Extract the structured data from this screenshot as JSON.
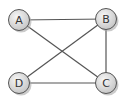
{
  "diagram": {
    "type": "undirected-graph",
    "colors": {
      "edge": "#555555",
      "node_stroke": "#555555",
      "node_fill_light": "#f2f2f2",
      "node_fill_dark": "#c8c8c8",
      "shadow": "#9a9a9a",
      "label": "#333333"
    },
    "nodes": [
      {
        "id": "A",
        "label": "A",
        "x": 19,
        "y": 20
      },
      {
        "id": "B",
        "label": "B",
        "x": 106,
        "y": 19
      },
      {
        "id": "D",
        "label": "D",
        "x": 19,
        "y": 83
      },
      {
        "id": "C",
        "label": "C",
        "x": 106,
        "y": 83
      }
    ],
    "edges": [
      {
        "from": "A",
        "to": "B"
      },
      {
        "from": "A",
        "to": "C"
      },
      {
        "from": "B",
        "to": "D"
      },
      {
        "from": "B",
        "to": "C"
      },
      {
        "from": "D",
        "to": "C"
      }
    ]
  }
}
